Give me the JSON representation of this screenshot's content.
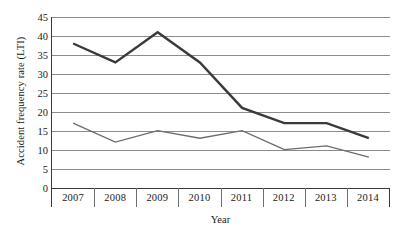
{
  "chart_data": {
    "type": "line",
    "title": "",
    "xlabel": "Year",
    "ylabel": "Accident frequency rate (LTI)",
    "categories": [
      "2007",
      "2008",
      "2009",
      "2010",
      "2011",
      "2012",
      "2013",
      "2014"
    ],
    "series": [
      {
        "name": "series-upper",
        "color": "#3a3a3a",
        "stroke_width": 2.4,
        "values": [
          38,
          33,
          41,
          33,
          21,
          17,
          17,
          13
        ]
      },
      {
        "name": "series-lower",
        "color": "#6b6b6b",
        "stroke_width": 1.3,
        "values": [
          17,
          12,
          15,
          13,
          15,
          10,
          11,
          8
        ]
      }
    ],
    "ylim": [
      0,
      45
    ],
    "ytick_step": 5,
    "yticks": [
      "45",
      "40",
      "35",
      "30",
      "25",
      "20",
      "15",
      "10",
      "5",
      "0"
    ],
    "grid": true,
    "legend": "none",
    "gridline_color": "#8c8c8c",
    "axis_color": "#3a3a3a",
    "background": "#ffffff"
  }
}
